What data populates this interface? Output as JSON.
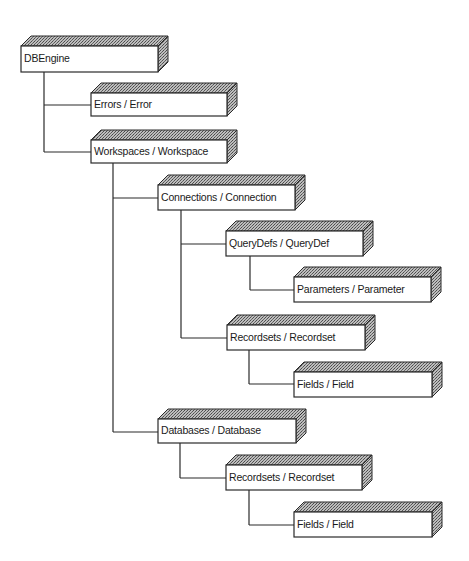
{
  "diagram": {
    "colors": {
      "background": "#ffffff",
      "line": "#2a2a2a",
      "face": "#ffffff",
      "hatch_dark": "#555555",
      "hatch_light": "#bdbdbd",
      "text": "#1a1a1a"
    },
    "box_depth": {
      "dx": 10,
      "dy": 10
    },
    "nodes": [
      {
        "id": "dbengine",
        "label": "DBEngine",
        "x": 21,
        "y": 46,
        "w": 137,
        "h": 26
      },
      {
        "id": "errors",
        "label": "Errors / Error",
        "x": 91,
        "y": 93,
        "w": 136,
        "h": 23
      },
      {
        "id": "workspaces",
        "label": "Workspaces / Workspace",
        "x": 91,
        "y": 140,
        "w": 136,
        "h": 23
      },
      {
        "id": "connections",
        "label": "Connections / Connection",
        "x": 158,
        "y": 185,
        "w": 137,
        "h": 25
      },
      {
        "id": "querydefs",
        "label": "QueryDefs / QueryDef",
        "x": 226,
        "y": 231,
        "w": 137,
        "h": 25
      },
      {
        "id": "parameters",
        "label": "Parameters / Parameter",
        "x": 294,
        "y": 277,
        "w": 137,
        "h": 25
      },
      {
        "id": "recordsets-1",
        "label": "Recordsets / Recordset",
        "x": 227,
        "y": 325,
        "w": 138,
        "h": 25
      },
      {
        "id": "fields-1",
        "label": "Fields / Field",
        "x": 294,
        "y": 372,
        "w": 138,
        "h": 25
      },
      {
        "id": "databases",
        "label": "Databases / Database",
        "x": 158,
        "y": 419,
        "w": 138,
        "h": 24
      },
      {
        "id": "recordsets-2",
        "label": "Recordsets / Recordset",
        "x": 226,
        "y": 465,
        "w": 136,
        "h": 25
      },
      {
        "id": "fields-2",
        "label": "Fields / Field",
        "x": 294,
        "y": 512,
        "w": 138,
        "h": 25
      }
    ],
    "edges": [
      {
        "from": "dbengine",
        "to": "errors",
        "trunk_x": 44,
        "y": 105
      },
      {
        "from": "dbengine",
        "to": "workspaces",
        "trunk_x": 44,
        "y": 152
      },
      {
        "from": "workspaces",
        "to": "connections",
        "trunk_x": 113,
        "y": 198
      },
      {
        "from": "workspaces",
        "to": "databases",
        "trunk_x": 113,
        "y": 432
      },
      {
        "from": "connections",
        "to": "querydefs",
        "trunk_x": 181,
        "y": 244
      },
      {
        "from": "connections",
        "to": "recordsets-1",
        "trunk_x": 181,
        "y": 338
      },
      {
        "from": "querydefs",
        "to": "parameters",
        "trunk_x": 250,
        "y": 290
      },
      {
        "from": "recordsets-1",
        "to": "fields-1",
        "trunk_x": 249,
        "y": 384
      },
      {
        "from": "databases",
        "to": "recordsets-2",
        "trunk_x": 180,
        "y": 478
      },
      {
        "from": "recordsets-2",
        "to": "fields-2",
        "trunk_x": 249,
        "y": 525
      }
    ]
  }
}
